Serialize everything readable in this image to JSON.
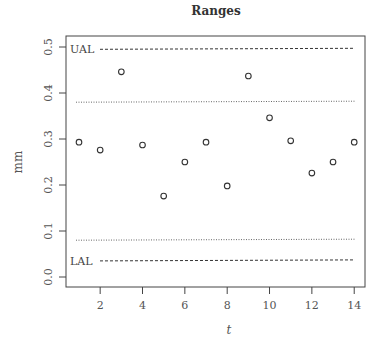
{
  "chart_data": {
    "type": "scatter",
    "title": "Ranges",
    "xlabel": "t",
    "ylabel": "mm",
    "xlim": [
      0.6,
      14.5
    ],
    "ylim": [
      -0.02,
      0.52
    ],
    "xticks": [
      2,
      4,
      6,
      8,
      10,
      12,
      14
    ],
    "yticks": [
      0.0,
      0.1,
      0.2,
      0.3,
      0.4,
      0.5
    ],
    "ytick_labels": [
      "0.0",
      "0.1",
      "0.2",
      "0.3",
      "0.4",
      "0.5"
    ],
    "grid": false,
    "x": [
      1,
      2,
      3,
      4,
      5,
      6,
      7,
      8,
      9,
      10,
      11,
      12,
      13,
      14
    ],
    "y": [
      0.293,
      0.276,
      0.446,
      0.287,
      0.176,
      0.25,
      0.293,
      0.198,
      0.437,
      0.346,
      0.296,
      0.226,
      0.25,
      0.293
    ],
    "marker": "open-circle",
    "reference_lines": [
      {
        "name": "UAL",
        "value": 0.495,
        "style": "dashed",
        "label": "UAL"
      },
      {
        "name": "upper-warning",
        "value": 0.38,
        "style": "dotted",
        "label": ""
      },
      {
        "name": "lower-warning",
        "value": 0.08,
        "style": "dotted",
        "label": ""
      },
      {
        "name": "LAL",
        "value": 0.035,
        "style": "dashed",
        "label": "LAL"
      }
    ]
  }
}
